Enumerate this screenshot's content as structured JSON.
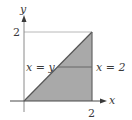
{
  "diagram": {
    "type": "region-plot",
    "axes": {
      "x_label": "x",
      "y_label": "y",
      "x_tick": "2",
      "y_tick": "2"
    },
    "curves": {
      "diagonal_label": "x = y",
      "vertical_label": "x = 2"
    },
    "region": {
      "vertices": [
        [
          0,
          0
        ],
        [
          2,
          0
        ],
        [
          2,
          2
        ]
      ],
      "fill_color": "#a9a9a9"
    },
    "colors": {
      "axis": "#4a4a4a",
      "guide": "#b8b8b8",
      "text": "#3a3a3a",
      "fill": "#a9a9a9"
    }
  }
}
